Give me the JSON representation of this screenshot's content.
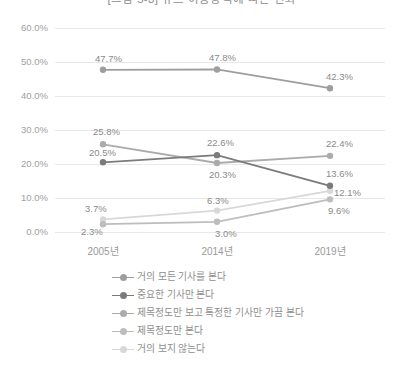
{
  "chart_data": {
    "type": "line",
    "title": "[그림 5-3] 뉴스 이용방식에 따른 변화",
    "xlabel": "",
    "ylabel": "",
    "categories": [
      "2005년",
      "2014년",
      "2019년"
    ],
    "ylim": [
      0,
      60
    ],
    "ytick_labels": [
      "0.0%",
      "10.0%",
      "20.0%",
      "30.0%",
      "40.0%",
      "50.0%",
      "60.0%"
    ],
    "ytick_values": [
      0,
      10,
      20,
      30,
      40,
      50,
      60
    ],
    "grid": true,
    "legend_position": "bottom",
    "series": [
      {
        "name": "거의 모든 기사를 본다",
        "color": "#9e9e9e",
        "values": [
          47.7,
          47.8,
          42.3
        ],
        "labels": [
          "47.7%",
          "47.8%",
          "42.3%"
        ]
      },
      {
        "name": "중요한 기사만 본다",
        "color": "#7b7b7b",
        "values": [
          20.5,
          22.6,
          13.6
        ],
        "labels": [
          "20.5%",
          "22.6%",
          "13.6%"
        ]
      },
      {
        "name": "제목정도만 보고 특정한 기사만 가끔 본다",
        "color": "#ababab",
        "values": [
          25.8,
          20.3,
          22.4
        ],
        "labels": [
          "25.8%",
          "20.3%",
          "22.4%"
        ]
      },
      {
        "name": "제목정도만 본다",
        "color": "#bdbdbd",
        "values": [
          2.3,
          3.0,
          9.6
        ],
        "labels": [
          "2.3%",
          "3.0%",
          "9.6%"
        ]
      },
      {
        "name": "거의 보지 않는다",
        "color": "#d8d8d8",
        "values": [
          3.7,
          6.3,
          12.1
        ],
        "labels": [
          "3.7%",
          "6.3%",
          "12.1%"
        ]
      }
    ]
  }
}
